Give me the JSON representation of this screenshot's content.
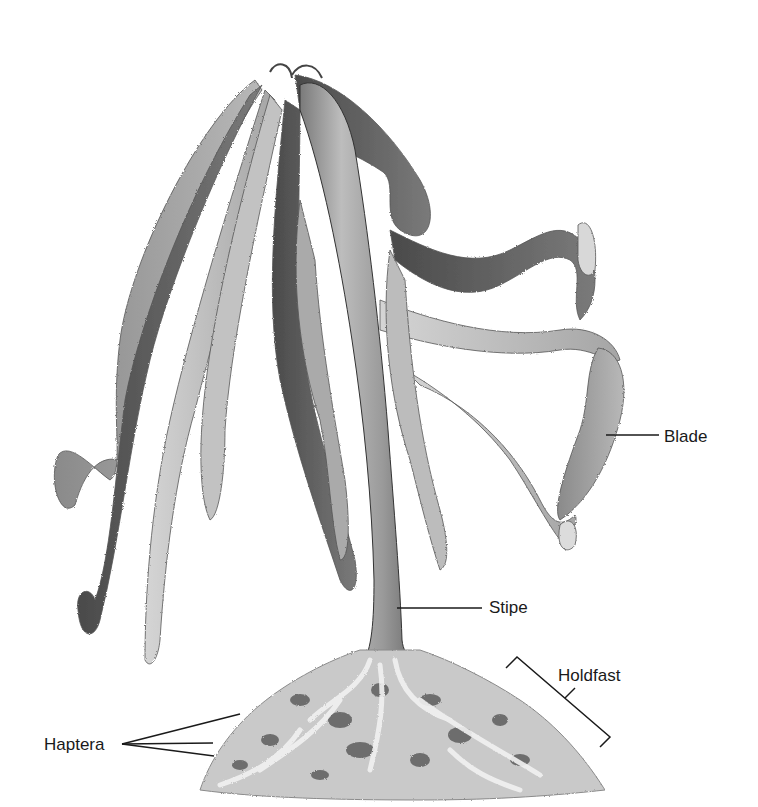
{
  "diagram": {
    "colors": {
      "background": "#ffffff",
      "label_text": "#1a1a1a",
      "leader_line": "#1a1a1a",
      "blade_light": "#c8c8c8",
      "blade_mid": "#9a9a9a",
      "blade_dark": "#5a5a5a",
      "stipe": "#a8a8a8",
      "holdfast": "#b5b5b5"
    },
    "labels": {
      "blade": "Blade",
      "stipe": "Stipe",
      "holdfast": "Holdfast",
      "haptera": "Haptera"
    }
  }
}
